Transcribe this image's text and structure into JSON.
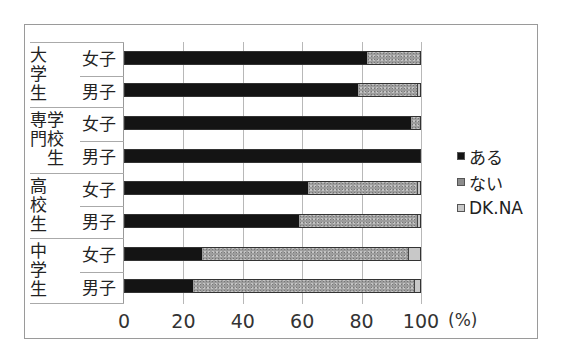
{
  "chart_data": {
    "type": "bar",
    "orientation": "horizontal",
    "stacked": true,
    "title": "",
    "xlabel": "(%)",
    "ylabel": "",
    "xlim": [
      0,
      100
    ],
    "x_ticks": [
      "0",
      "20",
      "40",
      "60",
      "80",
      "100"
    ],
    "grid": true,
    "legend_position": "right",
    "groups": [
      {
        "label": "大\n学\n生",
        "name": "大学生",
        "rows": [
          "女子",
          "男子"
        ]
      },
      {
        "label": "専学\n門校\n　生",
        "name": "専門学校生",
        "rows": [
          "女子",
          "男子"
        ]
      },
      {
        "label": "高\n校\n生",
        "name": "高校生",
        "rows": [
          "女子",
          "男子"
        ]
      },
      {
        "label": "中\n学\n生",
        "name": "中学生",
        "rows": [
          "女子",
          "男子"
        ]
      }
    ],
    "categories": [
      "大学生 女子",
      "大学生 男子",
      "専門学校生 女子",
      "専門学校生 男子",
      "高校生 女子",
      "高校生 男子",
      "中学生 女子",
      "中学生 男子"
    ],
    "series": [
      {
        "name": "ある",
        "color": "#141414",
        "values": [
          82,
          79,
          97,
          100,
          62,
          59,
          26,
          23
        ]
      },
      {
        "name": "ない",
        "color": "#9d9d9d",
        "values": [
          18,
          20,
          3,
          0,
          37,
          40,
          70,
          75
        ]
      },
      {
        "name": "DK.NA",
        "color": "#c8c8c8",
        "values": [
          0,
          1,
          0,
          0,
          1,
          1,
          4,
          2
        ]
      }
    ]
  },
  "legend": [
    {
      "label": "ある",
      "color": "#141414"
    },
    {
      "label": "ない",
      "color": "#8c8c8c"
    },
    {
      "label": "DK.NA",
      "color": "#c8c8c8"
    }
  ],
  "axis": {
    "unit": "(%)"
  }
}
